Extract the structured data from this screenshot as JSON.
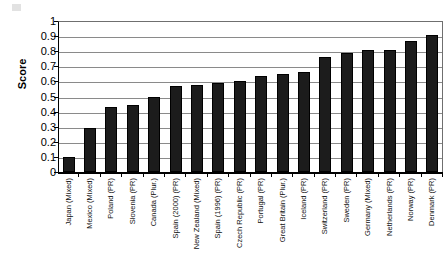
{
  "chart_data": {
    "type": "bar",
    "title": "",
    "xlabel": "",
    "ylabel": "Score",
    "ylim": [
      0,
      1
    ],
    "ytick_step": 0.1,
    "grid": true,
    "legend": "none",
    "bar_color": "#1c1c1c",
    "ytick_labels": [
      "1",
      "0.9",
      "0.8",
      "0.7",
      "0.6",
      "0.5",
      "0.4",
      "0.3",
      "0.2",
      "0.1",
      "0"
    ],
    "ytick_values": [
      1,
      0.9,
      0.8,
      0.7,
      0.6,
      0.5,
      0.4,
      0.3,
      0.2,
      0.1,
      0
    ],
    "categories": [
      "Japan (Mixed)",
      "Mexico (Mixed)",
      "Poland (PR)",
      "Slovenia (PR)",
      "Canada (Plur.)",
      "Spain (2000) (PR)",
      "New Zealand (Mixed)",
      "Spain (1996) (PR)",
      "Czech Republic (PR)",
      "Portugal (PR)",
      "Great Britain (Plur.)",
      "Iceland (PR)",
      "Switzerland (PR)",
      "Sweden (PR)",
      "Germany (Mixed)",
      "Netherlands (PR)",
      "Norway (PR)",
      "Denmark (PR)"
    ],
    "values": [
      0.1,
      0.29,
      0.43,
      0.445,
      0.495,
      0.57,
      0.575,
      0.59,
      0.605,
      0.635,
      0.65,
      0.66,
      0.765,
      0.785,
      0.805,
      0.805,
      0.865,
      0.905
    ]
  }
}
